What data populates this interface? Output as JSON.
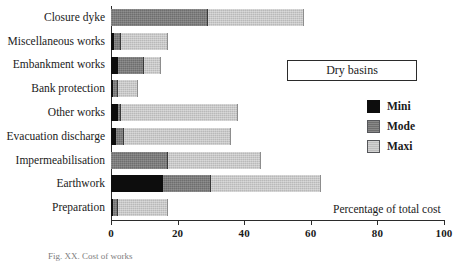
{
  "chart_data": {
    "type": "bar",
    "orientation": "horizontal",
    "stacked": true,
    "title": "Dry basins",
    "xlabel": "Percentage of total cost",
    "ylabel": "",
    "xlim": [
      0,
      100
    ],
    "xticks": [
      0,
      20,
      40,
      60,
      80,
      100
    ],
    "xtick_labels": [
      "0",
      "20",
      "40",
      "60",
      "80",
      "100"
    ],
    "grid": false,
    "legend_position": "right",
    "legend_entries": [
      "Mini",
      "Mode",
      "Maxi"
    ],
    "categories": [
      "Closure dyke",
      "Miscellaneous works",
      "Embankment works",
      "Bank protection",
      "Other works",
      "Evacuation discharge",
      "Impermeabilisation",
      "Earthwork",
      "Preparation"
    ],
    "series": [
      {
        "name": "Mini",
        "color": "#0d0d0d",
        "values": [
          0,
          1,
          2,
          0.5,
          2,
          1.5,
          0,
          15.5,
          0.5
        ]
      },
      {
        "name": "Mode",
        "color": "#6e6e6e",
        "values": [
          29,
          3,
          10,
          2,
          3,
          4,
          17,
          30,
          2
        ]
      },
      {
        "name": "Maxi",
        "color": "#bdbdbd",
        "values": [
          58,
          17,
          15,
          8,
          38,
          36,
          45,
          63,
          17
        ]
      }
    ],
    "note": "Series values are cumulative end points of each stacked segment, read off the 0-100 axis."
  },
  "chart": {
    "title_box_label": "Dry basins",
    "x_axis_caption": "Percentage of total cost"
  },
  "legend": {
    "items": [
      {
        "label": "Mini",
        "swatch": "mini-swatch-icon"
      },
      {
        "label": "Mode",
        "swatch": "mode-swatch-icon"
      },
      {
        "label": "Maxi",
        "swatch": "maxi-swatch-icon"
      }
    ]
  },
  "figure_caption": "Fig. XX.  Cost of works"
}
